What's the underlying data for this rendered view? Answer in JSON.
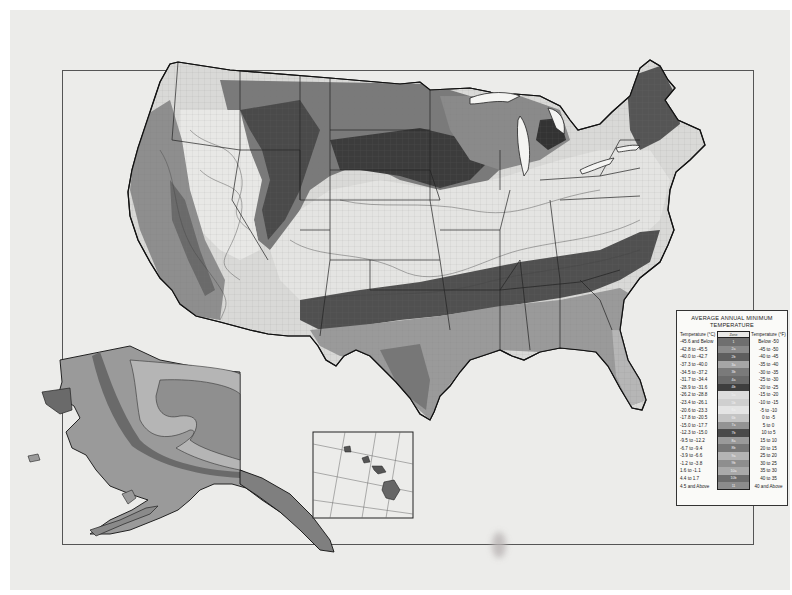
{
  "map": {
    "subject": "USDA Plant Hardiness Zone Map of the United States",
    "insets": [
      "Alaska",
      "Hawaii"
    ],
    "rendering": "grayscale scanned print"
  },
  "legend": {
    "title_line1": "Average Annual Minimum",
    "title_line2": "Temperature",
    "header_celsius": "Temperature (°C)",
    "header_zone": "Zone",
    "header_fahrenheit": "Temperature (°F)",
    "rows": [
      {
        "celsius": "-45.6 and Below",
        "zone": "1",
        "fahrenheit": "Below -50",
        "shade": "#6f6f6f"
      },
      {
        "celsius": "-42.8 to -45.5",
        "zone": "2a",
        "fahrenheit": "-45 to -50",
        "shade": "#8a8a8a"
      },
      {
        "celsius": "-40.0 to -42.7",
        "zone": "2b",
        "fahrenheit": "-40 to -45",
        "shade": "#5e5e5e"
      },
      {
        "celsius": "-37.3 to -40.0",
        "zone": "3a",
        "fahrenheit": "-35 to -40",
        "shade": "#a6a6a6"
      },
      {
        "celsius": "-34.5 to -37.2",
        "zone": "3b",
        "fahrenheit": "-30 to -35",
        "shade": "#7a7a7a"
      },
      {
        "celsius": "-31.7 to -34.4",
        "zone": "4a",
        "fahrenheit": "-25 to -30",
        "shade": "#6a6a6a"
      },
      {
        "celsius": "-28.9 to -31.6",
        "zone": "4b",
        "fahrenheit": "-20 to -25",
        "shade": "#3e3e3e"
      },
      {
        "celsius": "-26.2 to -28.8",
        "zone": "5a",
        "fahrenheit": "-15 to -20",
        "shade": "#dcdcdc"
      },
      {
        "celsius": "-23.4 to -26.1",
        "zone": "5b",
        "fahrenheit": "-10 to -15",
        "shade": "#cfcfcf"
      },
      {
        "celsius": "-20.6 to -23.3",
        "zone": "6a",
        "fahrenheit": "-5 to -10",
        "shade": "#e4e4e4"
      },
      {
        "celsius": "-17.8 to -20.5",
        "zone": "6b",
        "fahrenheit": "0 to -5",
        "shade": "#c4c4c4"
      },
      {
        "celsius": "-15.0 to -17.7",
        "zone": "7a",
        "fahrenheit": "5 to 0",
        "shade": "#939393"
      },
      {
        "celsius": "-12.3 to -15.0",
        "zone": "7b",
        "fahrenheit": "10 to 5",
        "shade": "#4a4a4a"
      },
      {
        "celsius": "-9.5 to -12.2",
        "zone": "8a",
        "fahrenheit": "15 to 10",
        "shade": "#9a9a9a"
      },
      {
        "celsius": "-6.7 to -9.4",
        "zone": "8b",
        "fahrenheit": "20 to 15",
        "shade": "#777777"
      },
      {
        "celsius": "-3.9 to -6.6",
        "zone": "9a",
        "fahrenheit": "25 to 20",
        "shade": "#b4b4b4"
      },
      {
        "celsius": "-1.2 to -3.8",
        "zone": "9b",
        "fahrenheit": "30 to 25",
        "shade": "#8e8e8e"
      },
      {
        "celsius": "1.6 to -1.1",
        "zone": "10a",
        "fahrenheit": "35 to 30",
        "shade": "#a9a9a9"
      },
      {
        "celsius": "4.4 to 1.7",
        "zone": "10b",
        "fahrenheit": "40 to 35",
        "shade": "#6d6d6d"
      },
      {
        "celsius": "4.5 and Above",
        "zone": "11",
        "fahrenheit": "40 and Above",
        "shade": "#8c8c8c"
      }
    ]
  }
}
